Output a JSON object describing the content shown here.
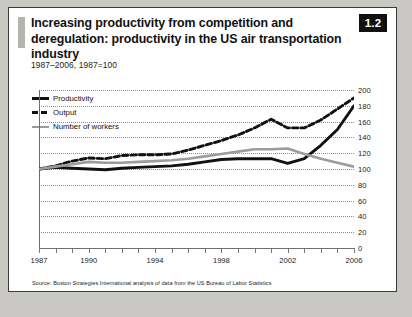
{
  "figure": {
    "badge": "1.2",
    "title": "Increasing productivity from competition and deregulation: productivity in the US air transportation industry",
    "subtitle": "1987–2006, 1987=100",
    "source": "Source: Boston Strategies International analysis of data from the US Bureau of Labor Statistics"
  },
  "colors": {
    "productivity": "#111111",
    "output": "#111111",
    "workers": "#9c9c9c",
    "grid": "#8e8e8e",
    "axis": "#6f6f6f",
    "badge_bg": "#111111",
    "accent_bar": "#b4b3b0",
    "page_bg": "#c9c8c4",
    "figure_bg": "#ffffff"
  },
  "chart_data": {
    "type": "line",
    "title": "Increasing productivity from competition and deregulation: productivity in the US air transportation industry",
    "subtitle": "1987–2006, 1987=100",
    "xlabel": "",
    "ylabel": "",
    "ylim": [
      0,
      200
    ],
    "yticks": [
      0,
      20,
      40,
      60,
      80,
      100,
      120,
      140,
      160,
      180,
      200
    ],
    "grid": "horizontal-dotted",
    "legend_position": "top-left",
    "x": [
      1987,
      1988,
      1989,
      1990,
      1991,
      1992,
      1993,
      1994,
      1995,
      1996,
      1997,
      1998,
      1999,
      2000,
      2001,
      2002,
      2003,
      2004,
      2005,
      2006
    ],
    "xticks_labeled": [
      1987,
      1990,
      1994,
      1998,
      2002,
      2006
    ],
    "series": [
      {
        "name": "Productivity",
        "style": "solid",
        "color": "#111111",
        "values": [
          100,
          102,
          101,
          100,
          99,
          101,
          102,
          103,
          104,
          106,
          109,
          112,
          113,
          113,
          113,
          107,
          113,
          130,
          150,
          180
        ]
      },
      {
        "name": "Output",
        "style": "dashed",
        "color": "#111111",
        "values": [
          100,
          104,
          110,
          114,
          113,
          117,
          118,
          118,
          119,
          124,
          130,
          136,
          143,
          152,
          163,
          152,
          152,
          162,
          176,
          190
        ]
      },
      {
        "name": "Number of workers",
        "style": "solid",
        "color": "#9c9c9c",
        "values": [
          100,
          103,
          106,
          109,
          108,
          108,
          109,
          110,
          111,
          113,
          116,
          119,
          122,
          125,
          125,
          126,
          119,
          113,
          108,
          103
        ]
      }
    ]
  }
}
